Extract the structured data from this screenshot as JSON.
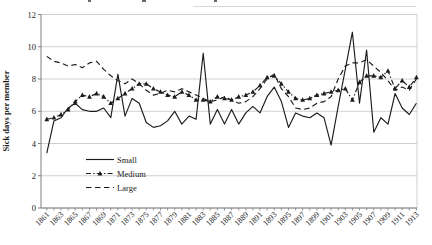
{
  "chart_data": {
    "type": "line",
    "title": "",
    "xlabel": "",
    "ylabel": "Sick days per member",
    "ylim": [
      0,
      12
    ],
    "y_ticks": [
      0,
      2,
      4,
      6,
      8,
      10,
      12
    ],
    "x_tick_label_step": 2,
    "grid": true,
    "legend_position": "inside-bottom-left",
    "x": [
      1861,
      1862,
      1863,
      1864,
      1865,
      1866,
      1867,
      1868,
      1869,
      1870,
      1871,
      1872,
      1873,
      1874,
      1875,
      1876,
      1877,
      1878,
      1879,
      1880,
      1881,
      1882,
      1883,
      1884,
      1885,
      1886,
      1887,
      1888,
      1889,
      1890,
      1891,
      1892,
      1893,
      1894,
      1895,
      1896,
      1897,
      1898,
      1899,
      1900,
      1901,
      1902,
      1903,
      1904,
      1905,
      1906,
      1907,
      1908,
      1909,
      1910,
      1911,
      1912,
      1913
    ],
    "series": [
      {
        "name": "Small",
        "style": "solid",
        "marker": "none",
        "color": "#1c1c1c",
        "values": [
          3.4,
          5.4,
          5.6,
          6.2,
          6.5,
          6.1,
          6.0,
          6.0,
          6.2,
          5.6,
          8.3,
          5.7,
          6.8,
          6.5,
          5.3,
          5.0,
          5.1,
          5.4,
          6.0,
          5.2,
          5.7,
          5.5,
          9.6,
          5.2,
          6.1,
          5.2,
          6.1,
          5.2,
          5.9,
          6.3,
          5.9,
          6.9,
          7.5,
          6.6,
          5.0,
          5.9,
          5.7,
          5.6,
          5.9,
          5.6,
          3.9,
          6.3,
          8.6,
          10.9,
          6.5,
          9.8,
          4.7,
          5.6,
          5.2,
          7.1,
          6.2,
          5.8,
          6.5
        ]
      },
      {
        "name": "Medium",
        "style": "dash-dot",
        "marker": "triangle",
        "color": "#1c1c1c",
        "values": [
          5.5,
          5.6,
          5.8,
          6.1,
          6.6,
          7.0,
          6.9,
          7.1,
          6.9,
          6.5,
          6.8,
          7.1,
          7.4,
          7.7,
          7.7,
          7.4,
          7.2,
          7.0,
          6.9,
          7.2,
          7.0,
          6.7,
          6.7,
          6.6,
          6.9,
          6.8,
          6.7,
          6.9,
          7.0,
          7.2,
          7.6,
          8.1,
          8.2,
          7.7,
          7.2,
          6.8,
          6.7,
          6.8,
          7.0,
          7.1,
          7.2,
          7.3,
          7.4,
          6.7,
          7.8,
          8.2,
          8.2,
          8.1,
          8.5,
          7.4,
          7.9,
          7.5,
          8.1
        ]
      },
      {
        "name": "Large",
        "style": "dashed",
        "marker": "none",
        "color": "#1c1c1c",
        "values": [
          9.4,
          9.1,
          9.0,
          8.8,
          8.9,
          8.7,
          9.0,
          9.1,
          8.6,
          8.2,
          7.9,
          7.7,
          8.0,
          7.7,
          7.3,
          7.0,
          7.1,
          7.3,
          7.2,
          7.4,
          7.2,
          7.0,
          6.8,
          6.6,
          6.7,
          6.9,
          6.7,
          6.5,
          6.6,
          6.9,
          7.4,
          8.0,
          8.3,
          7.4,
          6.9,
          6.2,
          6.1,
          6.2,
          6.5,
          6.6,
          6.9,
          8.0,
          8.8,
          9.0,
          9.0,
          9.2,
          8.8,
          8.4,
          7.9,
          7.3,
          7.5,
          7.3,
          8.0
        ]
      }
    ],
    "colors": {
      "line": "#1c1c1c",
      "grid": "#c4c4c4",
      "axis": "#808080",
      "text": "#1a1a1a",
      "background": "#ffffff"
    }
  }
}
